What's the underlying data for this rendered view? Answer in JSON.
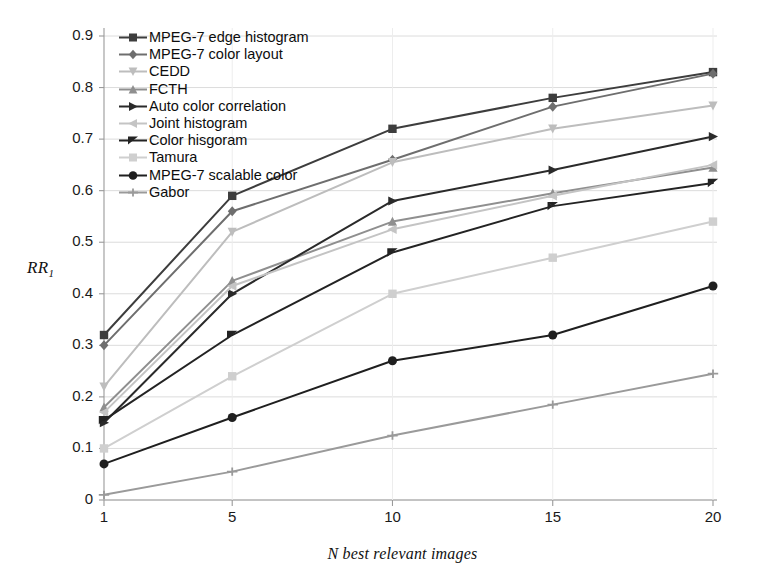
{
  "chart_data": {
    "type": "line",
    "title": "",
    "xlabel": "N best relevant images",
    "ylabel": "RR",
    "ylabel_sub": "1",
    "x": [
      1,
      5,
      10,
      15,
      20
    ],
    "xtick_labels": [
      "1",
      "5",
      "10",
      "15",
      "20"
    ],
    "ytick_labels": [
      "0",
      "0.1",
      "0.2",
      "0.3",
      "0.4",
      "0.5",
      "0.6",
      "0.7",
      "0.8",
      "0.9"
    ],
    "ytick_values": [
      0,
      0.1,
      0.2,
      0.3,
      0.4,
      0.5,
      0.6,
      0.7,
      0.8,
      0.9
    ],
    "xlim": [
      1,
      20
    ],
    "ylim": [
      0,
      0.9
    ],
    "grid": true,
    "legend_position": "top-left-inside",
    "series": [
      {
        "name": "MPEG-7 edge histogram",
        "values": [
          0.32,
          0.59,
          0.72,
          0.78,
          0.83
        ],
        "color": "#3d3d3d",
        "marker": "square"
      },
      {
        "name": "MPEG-7 color layout",
        "values": [
          0.3,
          0.56,
          0.66,
          0.763,
          0.827
        ],
        "color": "#6e6e6e",
        "marker": "diamond"
      },
      {
        "name": "CEDD",
        "values": [
          0.22,
          0.52,
          0.655,
          0.72,
          0.765
        ],
        "color": "#bdbdbd",
        "marker": "triangle-down"
      },
      {
        "name": "FCTH",
        "values": [
          0.18,
          0.425,
          0.54,
          0.595,
          0.645
        ],
        "color": "#8f8f8f",
        "marker": "triangle-up"
      },
      {
        "name": "Auto color correlation",
        "values": [
          0.15,
          0.4,
          0.58,
          0.64,
          0.705
        ],
        "color": "#2a2a2a",
        "marker": "triangle-right"
      },
      {
        "name": "Joint histogram",
        "values": [
          0.17,
          0.415,
          0.525,
          0.59,
          0.65
        ],
        "color": "#c4c4c4",
        "marker": "triangle-left"
      },
      {
        "name": "Color hisgoram",
        "values": [
          0.155,
          0.32,
          0.48,
          0.57,
          0.615
        ],
        "color": "#232323",
        "marker": "bowtie"
      },
      {
        "name": "Tamura",
        "values": [
          0.1,
          0.24,
          0.4,
          0.47,
          0.54
        ],
        "color": "#cfcfcf",
        "marker": "square"
      },
      {
        "name": "MPEG-7 scalable color",
        "values": [
          0.07,
          0.16,
          0.27,
          0.32,
          0.415
        ],
        "color": "#1f1f1f",
        "marker": "circle"
      },
      {
        "name": "Gabor",
        "values": [
          0.01,
          0.055,
          0.125,
          0.185,
          0.245
        ],
        "color": "#9a9a9a",
        "marker": "plus"
      }
    ]
  },
  "style": {
    "grid_color": "#dcdcdc",
    "axis_color": "#9a9a9a",
    "background": "#ffffff"
  }
}
